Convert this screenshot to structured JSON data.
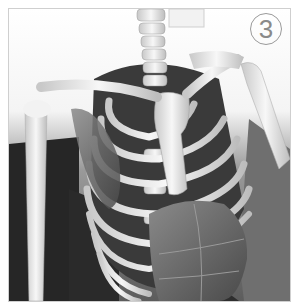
{
  "figure": {
    "step_label": "3",
    "colors": {
      "background_top": "#ffffff",
      "floor_dark": "#2a2a2a",
      "wood_wall": "#6e6e6e",
      "bone": "#eeeeee",
      "bone_shadow": "#b9b9b9",
      "muscle": "#6a6a6a",
      "frame_border": "#cfcfcf",
      "badge_stroke": "#9a9a9a"
    }
  }
}
